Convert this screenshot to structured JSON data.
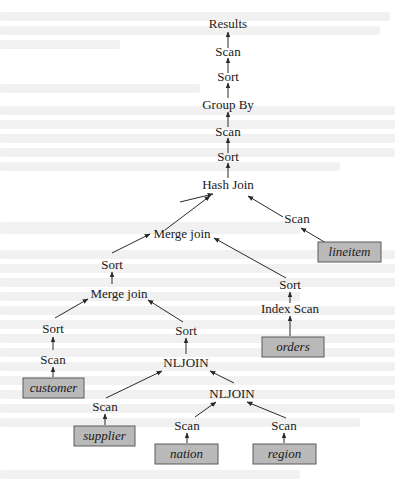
{
  "diagram": {
    "operators": {
      "results": "Results",
      "scan_top": "Scan",
      "sort_top": "Sort",
      "group_by": "Group By",
      "scan_2": "Scan",
      "sort_2": "Sort",
      "hash_join": "Hash Join",
      "scan_lineitem": "Scan",
      "merge_join_upper": "Merge join",
      "sort_left_upper": "Sort",
      "merge_join_lower": "Merge join",
      "sort_orders": "Sort",
      "index_scan": "Index Scan",
      "sort_customer": "Sort",
      "scan_customer": "Scan",
      "sort_nljoin": "Sort",
      "nljoin_upper": "NLJOIN",
      "scan_supplier": "Scan",
      "nljoin_lower": "NLJOIN",
      "scan_nation": "Scan",
      "scan_region": "Scan"
    },
    "tables": {
      "lineitem": "lineitem",
      "orders": "orders",
      "customer": "customer",
      "supplier": "supplier",
      "nation": "nation",
      "region": "region"
    },
    "colors": {
      "table_fill": "#b9b9b9",
      "table_border": "#5a5a5a",
      "edge": "#2a2a2a",
      "text": "#1a1a1a"
    }
  }
}
